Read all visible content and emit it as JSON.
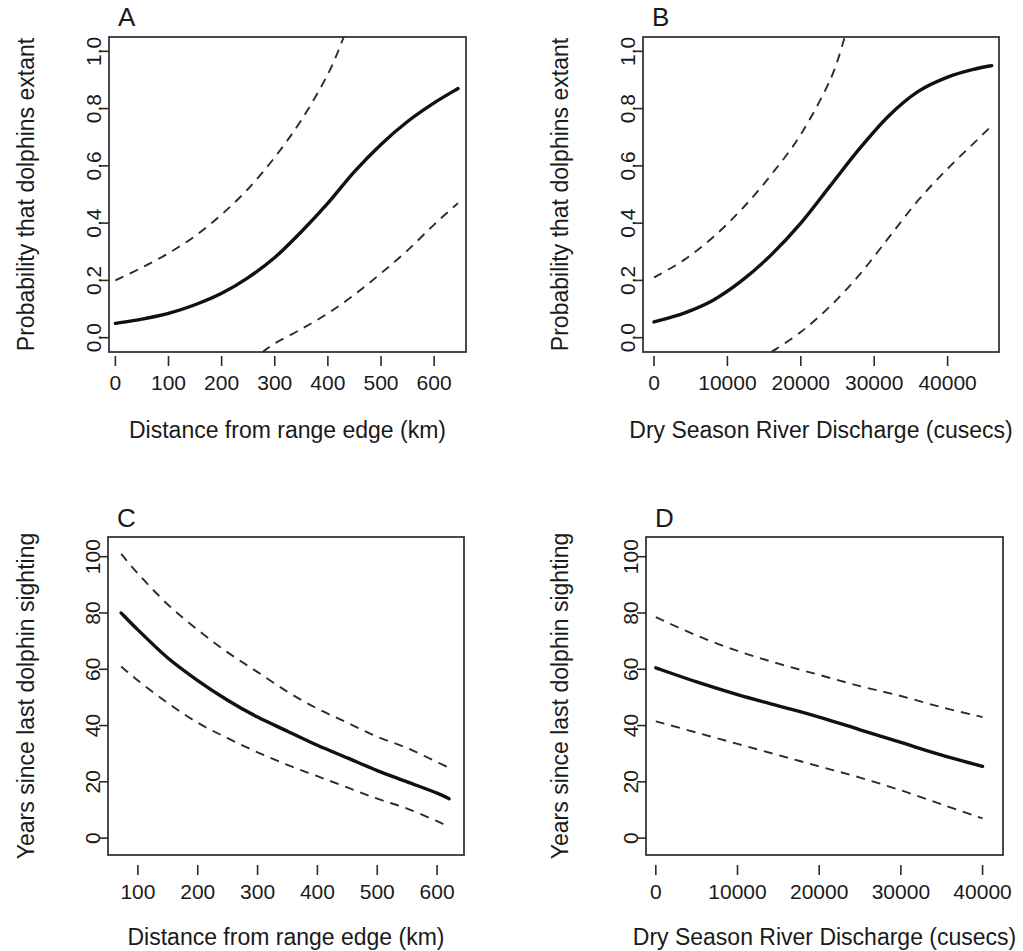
{
  "figure": {
    "background": "#ffffff",
    "line_color": "#111111",
    "ci_color": "#2b2b2b",
    "axis_color": "#2b2b2b"
  },
  "panels": [
    {
      "letter": "A",
      "xlabel": "Distance from range edge (km)",
      "ylabel": "Probability that dolphins extant",
      "xticks": [
        "0",
        "100",
        "200",
        "300",
        "400",
        "500",
        "600"
      ],
      "yticks": [
        "1.0",
        "0.8",
        "0.6",
        "0.4",
        "0.2",
        "0.0"
      ]
    },
    {
      "letter": "B",
      "xlabel": "Dry Season River Discharge (cusecs)",
      "ylabel": "Probability that dolphins extant",
      "xticks": [
        "0",
        "10000",
        "20000",
        "30000",
        "40000"
      ],
      "yticks": [
        "1.0",
        "0.8",
        "0.6",
        "0.4",
        "0.2",
        "0.0"
      ]
    },
    {
      "letter": "C",
      "xlabel": "Distance from range edge (km)",
      "ylabel": "Years since last dolphin sighting",
      "xticks": [
        "100",
        "200",
        "300",
        "400",
        "500",
        "600"
      ],
      "yticks": [
        "100",
        "80",
        "60",
        "40",
        "20",
        "0"
      ]
    },
    {
      "letter": "D",
      "xlabel": "Dry Season River Discharge (cusecs)",
      "ylabel": "Years since last dolphin sighting",
      "xticks": [
        "0",
        "10000",
        "20000",
        "30000",
        "40000"
      ],
      "yticks": [
        "100",
        "80",
        "60",
        "40",
        "20",
        "0"
      ]
    }
  ],
  "chart_data": [
    {
      "panel": "A",
      "type": "line",
      "title": "A",
      "xlabel": "Distance from range edge (km)",
      "ylabel": "Probability that dolphins extant",
      "xlim": [
        -12,
        660
      ],
      "ylim": [
        -0.05,
        1.05
      ],
      "xticks": [
        0,
        100,
        200,
        300,
        400,
        500,
        600
      ],
      "yticks": [
        0.0,
        0.2,
        0.4,
        0.6,
        0.8,
        1.0
      ],
      "grid": false,
      "legend": null,
      "series": [
        {
          "name": "fitted",
          "style": "solid",
          "x": [
            0,
            50,
            100,
            150,
            200,
            250,
            300,
            350,
            400,
            450,
            500,
            550,
            600,
            645
          ],
          "values": [
            0.05,
            0.065,
            0.085,
            0.115,
            0.155,
            0.21,
            0.28,
            0.37,
            0.47,
            0.58,
            0.675,
            0.755,
            0.82,
            0.87
          ]
        },
        {
          "name": "upper 95% CI",
          "style": "dashed",
          "x": [
            0,
            50,
            100,
            150,
            200,
            250,
            300,
            350,
            400,
            430
          ],
          "values": [
            0.2,
            0.245,
            0.295,
            0.355,
            0.43,
            0.52,
            0.63,
            0.76,
            0.92,
            1.05
          ]
        },
        {
          "name": "lower 95% CI",
          "style": "dashed",
          "x": [
            277,
            300,
            350,
            400,
            450,
            500,
            550,
            600,
            645
          ],
          "values": [
            -0.05,
            -0.02,
            0.03,
            0.085,
            0.15,
            0.225,
            0.305,
            0.395,
            0.47
          ]
        }
      ]
    },
    {
      "panel": "B",
      "type": "line",
      "title": "B",
      "xlabel": "Dry Season River Discharge (cusecs)",
      "ylabel": "Probability that dolphins extant",
      "xlim": [
        -1500,
        47000
      ],
      "ylim": [
        -0.05,
        1.05
      ],
      "xticks": [
        0,
        10000,
        20000,
        30000,
        40000
      ],
      "yticks": [
        0.0,
        0.2,
        0.4,
        0.6,
        0.8,
        1.0
      ],
      "grid": false,
      "legend": null,
      "series": [
        {
          "name": "fitted",
          "style": "solid",
          "x": [
            0,
            4000,
            8000,
            12000,
            16000,
            20000,
            24000,
            28000,
            32000,
            36000,
            40000,
            44000,
            46000
          ],
          "values": [
            0.055,
            0.085,
            0.13,
            0.2,
            0.29,
            0.4,
            0.53,
            0.66,
            0.775,
            0.86,
            0.91,
            0.94,
            0.95
          ]
        },
        {
          "name": "upper 95% CI",
          "style": "dashed",
          "x": [
            0,
            4000,
            8000,
            12000,
            16000,
            20000,
            24000,
            26000
          ],
          "values": [
            0.21,
            0.27,
            0.35,
            0.45,
            0.57,
            0.71,
            0.9,
            1.05
          ]
        },
        {
          "name": "lower 95% CI",
          "style": "dashed",
          "x": [
            16000,
            20000,
            24000,
            28000,
            32000,
            36000,
            40000,
            44000,
            46000
          ],
          "values": [
            -0.05,
            0.02,
            0.11,
            0.22,
            0.35,
            0.48,
            0.59,
            0.69,
            0.74
          ]
        }
      ]
    },
    {
      "panel": "C",
      "type": "line",
      "title": "C",
      "xlabel": "Distance from range edge (km)",
      "ylabel": "Years since last dolphin sighting",
      "xlim": [
        50,
        645
      ],
      "ylim": [
        -6,
        107
      ],
      "xticks": [
        100,
        200,
        300,
        400,
        500,
        600
      ],
      "yticks": [
        0,
        20,
        40,
        60,
        80,
        100
      ],
      "grid": false,
      "legend": null,
      "series": [
        {
          "name": "fitted",
          "style": "solid",
          "x": [
            72,
            100,
            150,
            200,
            250,
            300,
            350,
            400,
            450,
            500,
            550,
            600,
            620
          ],
          "values": [
            80,
            74,
            64,
            56,
            49,
            43,
            38,
            33,
            28.5,
            24,
            20,
            16,
            14
          ]
        },
        {
          "name": "upper 95% CI",
          "style": "dashed",
          "x": [
            72,
            100,
            150,
            200,
            250,
            300,
            350,
            400,
            450,
            500,
            550,
            600,
            620
          ],
          "values": [
            101,
            94,
            83,
            74,
            66,
            59,
            52,
            46,
            41,
            36,
            32,
            27,
            25
          ]
        },
        {
          "name": "lower 95% CI",
          "style": "dashed",
          "x": [
            72,
            100,
            150,
            200,
            250,
            300,
            350,
            400,
            450,
            500,
            550,
            600,
            620
          ],
          "values": [
            61,
            56,
            48,
            41,
            35.5,
            30.5,
            26,
            22,
            18,
            14,
            10.5,
            6,
            4
          ]
        }
      ]
    },
    {
      "panel": "D",
      "type": "line",
      "title": "D",
      "xlabel": "Dry Season River Discharge (cusecs)",
      "ylabel": "Years since last dolphin sighting",
      "xlim": [
        -1200,
        42500
      ],
      "ylim": [
        -6,
        107
      ],
      "xticks": [
        0,
        10000,
        20000,
        30000,
        40000
      ],
      "yticks": [
        0,
        20,
        40,
        60,
        80,
        100
      ],
      "grid": false,
      "legend": null,
      "series": [
        {
          "name": "fitted",
          "style": "solid",
          "x": [
            0,
            5000,
            10000,
            15000,
            20000,
            25000,
            30000,
            35000,
            40000
          ],
          "values": [
            60.5,
            55.5,
            51,
            47,
            43,
            38.5,
            34,
            29.5,
            25.5
          ]
        },
        {
          "name": "upper 95% CI",
          "style": "dashed",
          "x": [
            0,
            5000,
            10000,
            15000,
            20000,
            25000,
            30000,
            35000,
            40000
          ],
          "values": [
            78.5,
            72,
            66.5,
            62,
            58,
            54,
            50.5,
            46.5,
            43
          ]
        },
        {
          "name": "lower 95% CI",
          "style": "dashed",
          "x": [
            0,
            5000,
            10000,
            15000,
            20000,
            25000,
            30000,
            35000,
            40000
          ],
          "values": [
            41.5,
            37.5,
            33.5,
            29.5,
            25.5,
            21.5,
            17,
            12,
            7
          ]
        }
      ]
    }
  ]
}
